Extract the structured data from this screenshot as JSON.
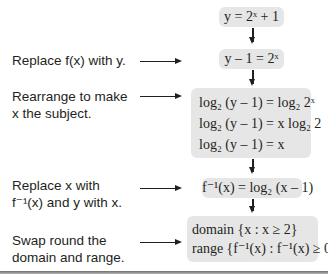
{
  "steps": [
    {
      "label": "",
      "box_lines": [
        "y = 2ˣ + 1"
      ]
    },
    {
      "label": "Replace f(x) with y.",
      "box_lines": [
        "y – 1 = 2ˣ"
      ]
    },
    {
      "label": "Rearrange to make x the subject.",
      "label_lines": [
        "Rearrange to make",
        "x the subject."
      ],
      "box_lines": [
        "log₂ (y – 1) = log₂ 2ˣ",
        "log₂ (y – 1) = x log₂ 2",
        "log₂ (y – 1) = x"
      ]
    },
    {
      "label": "Replace x with f⁻¹(x) and y with x.",
      "label_lines": [
        "Replace x with",
        "f⁻¹(x) and y with x."
      ],
      "box_lines": [
        "f⁻¹(x) = log₂ (x – 1)"
      ]
    },
    {
      "label": "Swap round the domain and range.",
      "label_lines": [
        "Swap round the",
        "domain and range."
      ],
      "box_lines": [
        "domain {x : x ≥ 2}",
        "range {f⁻¹(x) : f⁻¹(x) ≥ 0}"
      ]
    }
  ],
  "colors": {
    "box_fill": "#e6e6e6",
    "text": "#231f20"
  }
}
